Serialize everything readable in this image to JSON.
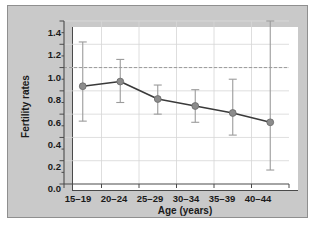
{
  "chart_data": {
    "type": "line",
    "title": "",
    "xlabel": "Age (years)",
    "ylabel": "Fertility rates",
    "categories": [
      "15–19",
      "20–24",
      "25–29",
      "30–34",
      "35–39",
      "40–44"
    ],
    "values": [
      0.84,
      0.88,
      0.73,
      0.67,
      0.61,
      0.53
    ],
    "error_low": [
      0.54,
      0.7,
      0.6,
      0.53,
      0.42,
      0.12
    ],
    "error_high": [
      1.22,
      1.07,
      0.85,
      0.81,
      0.9,
      1.4
    ],
    "ylim": [
      0.0,
      1.4
    ],
    "ytick_labels": [
      "1.4",
      "1.2",
      "1.0",
      "0.8",
      "0.6",
      "0.4",
      "0.2",
      "0.0"
    ],
    "ytick_values": [
      1.4,
      1.2,
      1.0,
      0.8,
      0.6,
      0.4,
      0.2,
      0.0
    ],
    "yminor_step": 0.1,
    "reference_line": {
      "value": 1.0,
      "style": "dashed",
      "label": ""
    },
    "grid": "y-major-and-x-category",
    "legend": "none",
    "series_name": "Fertility rates",
    "marker": "circle",
    "colors": {
      "marker": "#8c8c8c",
      "marker_edge": "#6e6e6e",
      "line": "#3a3a3a",
      "error_bar": "#9b9b9b",
      "reference_line": "#9b9b9b",
      "grid": "#d6d6d6",
      "axis": "#4a4a4a",
      "panel_background": "#ffffff",
      "card_background": "#c9c9c9",
      "card_border": "#8f8f8f",
      "text": "#1a1a1a"
    }
  }
}
